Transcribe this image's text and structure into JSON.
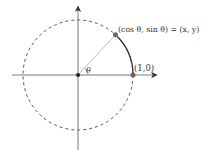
{
  "diagram": {
    "type": "unit-circle",
    "labels": {
      "point_label": "(cos θ, sin θ) = (x, y)",
      "unit_point_label": "(1,0)",
      "angle_label": "θ"
    },
    "geometry": {
      "center": [
        78,
        75
      ],
      "radius": 55,
      "angle_deg": 47
    },
    "colors": {
      "axes": "#555555",
      "circle": "#555555",
      "arc": "#333333",
      "radius_line": "#aaaaaa",
      "point": "#666666"
    }
  }
}
